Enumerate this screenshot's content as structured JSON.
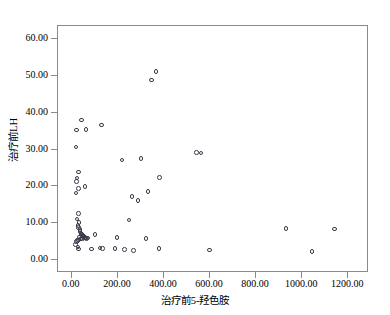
{
  "chart_data": {
    "type": "scatter",
    "title": "",
    "xlabel": "治疗前5-羟色胺",
    "ylabel": "治疗前LH",
    "xlim": [
      -60,
      1290
    ],
    "ylim": [
      -3.5,
      63.5
    ],
    "xticks": [
      "0.00",
      "200.00",
      "400.00",
      "600.00",
      "800.00",
      "1000.00",
      "1200.00"
    ],
    "xtick_values": [
      0,
      200,
      400,
      600,
      800,
      1000,
      1200
    ],
    "yticks": [
      "0.00",
      "10.00",
      "20.00",
      "30.00",
      "40.00",
      "50.00",
      "60.00"
    ],
    "ytick_values": [
      0,
      10,
      20,
      30,
      40,
      50,
      60
    ],
    "grid": false,
    "legend": null,
    "marker": "open-circle",
    "marker_color": "#3a3a4a",
    "series": [
      {
        "name": "治疗前5-羟色胺 vs 治疗前LH",
        "points": [
          [
            20,
            35.3
          ],
          [
            42,
            38.0
          ],
          [
            62,
            35.4
          ],
          [
            18,
            30.7
          ],
          [
            130,
            36.6
          ],
          [
            365,
            51.2
          ],
          [
            345,
            48.8
          ],
          [
            300,
            27.6
          ],
          [
            218,
            27.2
          ],
          [
            540,
            29.2
          ],
          [
            560,
            29.0
          ],
          [
            30,
            23.9
          ],
          [
            22,
            22.3
          ],
          [
            20,
            21.4
          ],
          [
            28,
            19.4
          ],
          [
            18,
            18.2
          ],
          [
            58,
            19.9
          ],
          [
            380,
            22.4
          ],
          [
            262,
            17.2
          ],
          [
            288,
            16.2
          ],
          [
            330,
            18.6
          ],
          [
            28,
            12.6
          ],
          [
            22,
            11.1
          ],
          [
            32,
            10.2
          ],
          [
            26,
            9.4
          ],
          [
            248,
            10.9
          ],
          [
            30,
            8.8
          ],
          [
            36,
            8.3
          ],
          [
            36,
            7.7
          ],
          [
            40,
            7.4
          ],
          [
            44,
            7.1
          ],
          [
            40,
            6.9
          ],
          [
            48,
            6.6
          ],
          [
            52,
            6.4
          ],
          [
            56,
            6.2
          ],
          [
            60,
            6.0
          ],
          [
            46,
            5.9
          ],
          [
            38,
            5.7
          ],
          [
            30,
            5.5
          ],
          [
            24,
            5.3
          ],
          [
            20,
            5.0
          ],
          [
            34,
            6.3
          ],
          [
            58,
            6.1
          ],
          [
            64,
            5.9
          ],
          [
            70,
            6.0
          ],
          [
            100,
            7.0
          ],
          [
            196,
            6.1
          ],
          [
            322,
            5.8
          ],
          [
            16,
            4.2
          ],
          [
            26,
            3.6
          ],
          [
            30,
            3.0
          ],
          [
            86,
            3.0
          ],
          [
            122,
            3.3
          ],
          [
            132,
            3.2
          ],
          [
            188,
            3.1
          ],
          [
            228,
            2.8
          ],
          [
            268,
            2.6
          ],
          [
            378,
            3.1
          ],
          [
            598,
            2.7
          ],
          [
            1042,
            2.4
          ],
          [
            930,
            8.6
          ],
          [
            1140,
            8.4
          ]
        ]
      }
    ]
  }
}
